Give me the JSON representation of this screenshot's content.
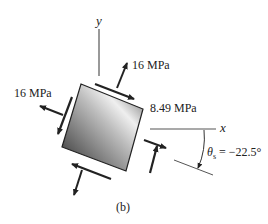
{
  "figure": {
    "caption": "(b)",
    "axes": {
      "x_label": "x",
      "y_label": "y"
    },
    "labels": {
      "top_normal": "16 MPa",
      "left_normal": "16 MPa",
      "shear": "8.49 MPa",
      "angle_symbol": "θ",
      "angle_subscript": "s",
      "angle_value": " = −22.5°"
    },
    "colors": {
      "ink": "#222222",
      "axis": "#555555",
      "element_dark": "#3a3a3a",
      "element_light": "#e8e8e8"
    }
  }
}
